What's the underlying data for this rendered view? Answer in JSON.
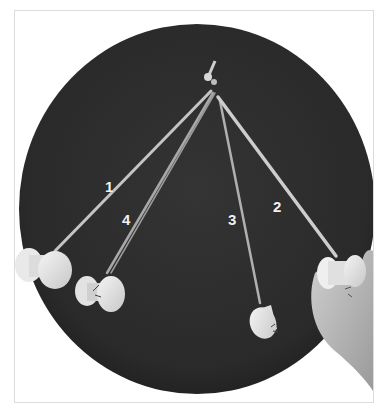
{
  "figure": {
    "colors": {
      "background": "#ffffff",
      "frame_border": "#dcdcdc",
      "disk": "#2e2e2e",
      "disk_edge": "#1f1f1f",
      "strand": "#bdbdbd",
      "bobbin": "#e6e6e6",
      "hand": "#b8b8b8",
      "label": "#f2f2f2"
    },
    "labels": [
      {
        "id": "1",
        "text": "1"
      },
      {
        "id": "2",
        "text": "2"
      },
      {
        "id": "3",
        "text": "3"
      },
      {
        "id": "4",
        "text": "4"
      }
    ]
  }
}
